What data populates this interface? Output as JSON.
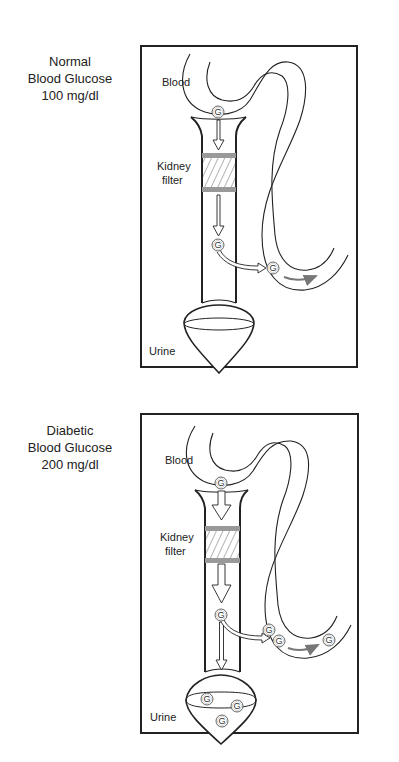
{
  "panels": [
    {
      "id": "normal",
      "caption": [
        "Normal",
        "Blood Glucose",
        "100 mg/dl"
      ],
      "labels": {
        "blood": "Blood",
        "kidney_line1": "Kidney",
        "kidney_line2": "filter",
        "urine": "Urine"
      },
      "glucose_symbol": "G",
      "glucose_counts": {
        "entering_filter": 1,
        "after_filter": 1,
        "reabsorbed_to_blood": 1,
        "in_urine": 0
      }
    },
    {
      "id": "diabetic",
      "caption": [
        "Diabetic",
        "Blood Glucose",
        "200 mg/dl"
      ],
      "labels": {
        "blood": "Blood",
        "kidney_line1": "Kidney",
        "kidney_line2": "filter",
        "urine": "Urine"
      },
      "glucose_symbol": "G",
      "glucose_counts": {
        "entering_filter": 1,
        "after_filter": 1,
        "reabsorbed_to_blood": 3,
        "in_urine": 3
      }
    }
  ],
  "colors": {
    "line": "#222222",
    "filter_band": "#999999",
    "flow_arrow": "#777777",
    "background": "#ffffff"
  }
}
